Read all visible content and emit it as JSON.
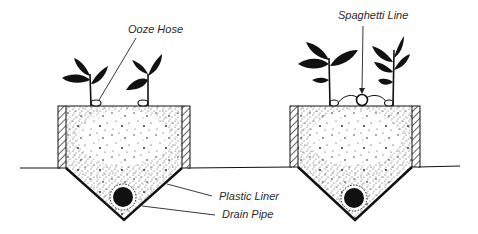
{
  "diagram": {
    "title": "",
    "colors": {
      "ink": "#111111",
      "soil_speckle": "#1a1a1a",
      "label": "#2a2a2a",
      "background": "#ffffff"
    },
    "beds": [
      {
        "id": "left-bed",
        "irrigation": "Ooze Hose",
        "plants": 2,
        "hoses": 2
      },
      {
        "id": "right-bed",
        "irrigation": "Spaghetti Line",
        "plants": 2,
        "emitters": 3
      }
    ],
    "labels": {
      "ooze_hose": "Ooze Hose",
      "spaghetti_line": "Spaghetti Line",
      "plastic_liner": "Plastic Liner",
      "drain_pipe": "Drain Pipe"
    }
  }
}
